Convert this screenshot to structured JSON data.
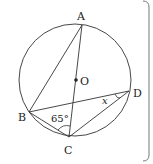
{
  "figure": {
    "colors": {
      "stroke": "#333333",
      "text": "#222222",
      "frame": "#777777",
      "background": "#ffffff"
    },
    "circle": {
      "center_label": "O",
      "cx": 75,
      "cy": 80,
      "r": 56
    },
    "points": [
      {
        "id": "A",
        "label": "A",
        "x": 82,
        "y": 25
      },
      {
        "id": "B",
        "label": "B",
        "x": 29,
        "y": 112
      },
      {
        "id": "C",
        "label": "C",
        "x": 69,
        "y": 137
      },
      {
        "id": "D",
        "label": "D",
        "x": 129,
        "y": 91
      },
      {
        "id": "O",
        "label": "O",
        "x": 76,
        "y": 80
      }
    ],
    "segments": [
      "AB",
      "AC",
      "BD",
      "BC",
      "CD"
    ],
    "angles": [
      {
        "at": "C",
        "between": [
          "B",
          "A"
        ],
        "label": "65°"
      },
      {
        "at": "D",
        "between": [
          "B",
          "C"
        ],
        "label": "x"
      }
    ]
  },
  "labels": {
    "A": "A",
    "B": "B",
    "C": "C",
    "D": "D",
    "O": "O",
    "angle_C": "65°",
    "angle_D": "x"
  }
}
